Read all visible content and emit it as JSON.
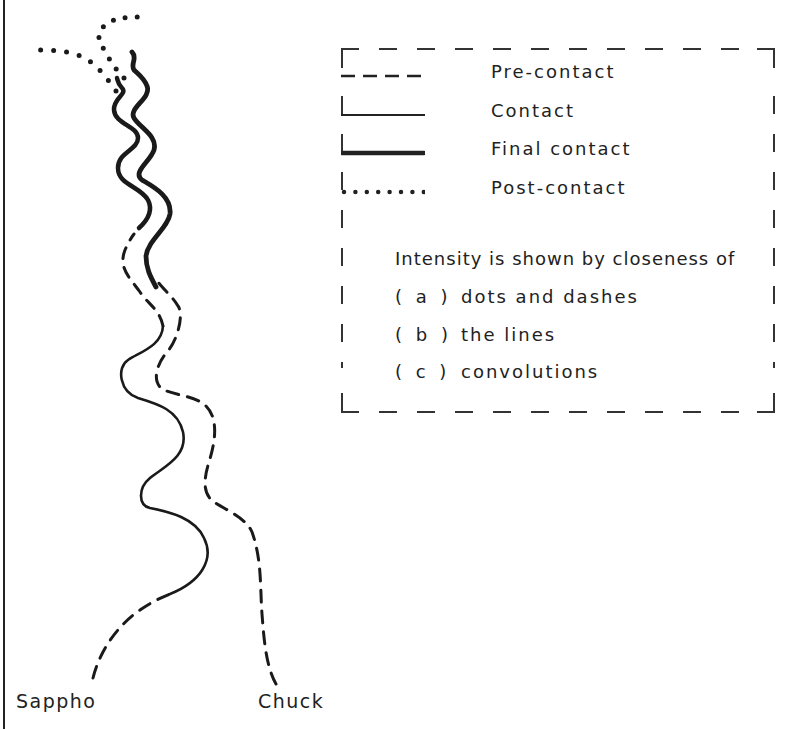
{
  "diagram": {
    "type": "relationship-path-diagram",
    "paths": [
      {
        "name": "Sappho",
        "label": "Sappho",
        "label_pos": {
          "x": 16,
          "y": 690
        }
      },
      {
        "name": "Chuck",
        "label": "Chuck",
        "label_pos": {
          "x": 258,
          "y": 690
        }
      }
    ],
    "colors": {
      "ink": "#1a1a1a",
      "background": "#ffffff"
    }
  },
  "legend": {
    "entries": [
      {
        "style": "dashed",
        "label": "Pre-contact"
      },
      {
        "style": "solid-thin",
        "label": "Contact"
      },
      {
        "style": "solid-thick",
        "label": "Final contact"
      },
      {
        "style": "dotted",
        "label": "Post-contact"
      }
    ],
    "note": {
      "heading": "Intensity is shown by closeness of",
      "items": [
        {
          "key": "( a )",
          "text": "dots and dashes"
        },
        {
          "key": "( b )",
          "text": "the lines"
        },
        {
          "key": "( c )",
          "text": "convolutions"
        }
      ]
    }
  }
}
